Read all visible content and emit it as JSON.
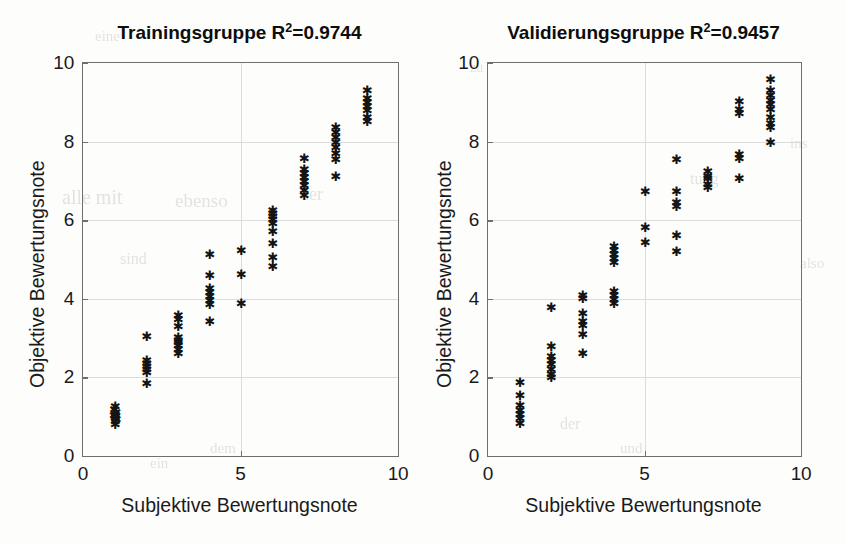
{
  "figure": {
    "background_color": "#fdfdfc",
    "axis_color": "#6f6f6f",
    "grid_color": "#dcdcdc",
    "marker_color": "#141414",
    "marker_glyph": "asterisk"
  },
  "panels": [
    {
      "id": "training",
      "title_main": "Trainingsgruppe R",
      "title_sup": "2",
      "title_tail": "=0.9744",
      "xlabel": "Subjektive Bewertungsnote",
      "ylabel": "Objektive Bewertungsnote",
      "xticks": [
        "0",
        "5",
        "10"
      ],
      "yticks": [
        "0",
        "2",
        "4",
        "6",
        "8",
        "10"
      ]
    },
    {
      "id": "validation",
      "title_main": "Validierungsgruppe R",
      "title_sup": "2",
      "title_tail": "=0.9457",
      "xlabel": "Subjektive Bewertungsnote",
      "ylabel": "Objektive Bewertungsnote",
      "xticks": [
        "0",
        "5",
        "10"
      ],
      "yticks": [
        "0",
        "2",
        "4",
        "6",
        "8",
        "10"
      ]
    }
  ],
  "bleed_artifacts": [
    {
      "text": "alle mit",
      "x": 62,
      "y": 186,
      "size": 20
    },
    {
      "text": "ebenso",
      "x": 175,
      "y": 190,
      "size": 19
    },
    {
      "text": "der",
      "x": 300,
      "y": 184,
      "size": 18
    },
    {
      "text": "eine",
      "x": 95,
      "y": 28,
      "size": 15
    },
    {
      "text": "sind",
      "x": 120,
      "y": 250,
      "size": 16
    },
    {
      "text": "ein",
      "x": 150,
      "y": 455,
      "size": 15
    },
    {
      "text": "dem",
      "x": 210,
      "y": 440,
      "size": 15
    },
    {
      "text": "tung",
      "x": 690,
      "y": 170,
      "size": 16
    },
    {
      "text": "ins",
      "x": 790,
      "y": 135,
      "size": 15
    },
    {
      "text": "der",
      "x": 560,
      "y": 415,
      "size": 16
    },
    {
      "text": "und",
      "x": 620,
      "y": 440,
      "size": 15
    },
    {
      "text": "also",
      "x": 800,
      "y": 255,
      "size": 15
    },
    {
      "text": "zu",
      "x": 470,
      "y": 60,
      "size": 14
    }
  ],
  "chart_data": [
    {
      "type": "scatter",
      "title": "Trainingsgruppe R2=0.9744",
      "xlabel": "Subjektive Bewertungsnote",
      "ylabel": "Objektive Bewertungsnote",
      "xlim": [
        0,
        10
      ],
      "ylim": [
        0,
        10
      ],
      "xticks": [
        0,
        5,
        10
      ],
      "yticks": [
        0,
        2,
        4,
        6,
        8,
        10
      ],
      "grid": true,
      "legend": null,
      "marker": "*",
      "r_squared": 0.9744,
      "points": [
        [
          1.0,
          0.8
        ],
        [
          1.0,
          0.88
        ],
        [
          1.0,
          0.95
        ],
        [
          1.0,
          1.0
        ],
        [
          1.0,
          1.05
        ],
        [
          1.02,
          1.1
        ],
        [
          0.98,
          1.18
        ],
        [
          1.0,
          1.25
        ],
        [
          1.03,
          0.92
        ],
        [
          0.97,
          1.02
        ],
        [
          2.0,
          1.85
        ],
        [
          2.0,
          2.12
        ],
        [
          2.0,
          2.2
        ],
        [
          2.0,
          2.28
        ],
        [
          2.0,
          2.35
        ],
        [
          2.0,
          2.42
        ],
        [
          2.0,
          3.05
        ],
        [
          3.0,
          2.62
        ],
        [
          3.0,
          2.72
        ],
        [
          3.0,
          2.8
        ],
        [
          3.0,
          2.88
        ],
        [
          3.0,
          2.95
        ],
        [
          3.0,
          3.02
        ],
        [
          3.0,
          3.3
        ],
        [
          3.0,
          3.48
        ],
        [
          3.0,
          3.58
        ],
        [
          4.0,
          3.42
        ],
        [
          4.0,
          3.85
        ],
        [
          4.0,
          3.95
        ],
        [
          4.0,
          4.05
        ],
        [
          4.0,
          4.15
        ],
        [
          4.0,
          4.25
        ],
        [
          4.0,
          4.6
        ],
        [
          4.0,
          5.12
        ],
        [
          5.0,
          3.88
        ],
        [
          5.0,
          4.62
        ],
        [
          5.0,
          5.22
        ],
        [
          6.0,
          4.82
        ],
        [
          6.0,
          5.05
        ],
        [
          6.0,
          5.4
        ],
        [
          6.0,
          5.72
        ],
        [
          6.0,
          5.92
        ],
        [
          6.0,
          6.02
        ],
        [
          6.0,
          6.1
        ],
        [
          6.0,
          6.18
        ],
        [
          6.0,
          6.25
        ],
        [
          7.0,
          6.62
        ],
        [
          7.0,
          6.75
        ],
        [
          7.0,
          6.88
        ],
        [
          7.0,
          6.98
        ],
        [
          7.0,
          7.08
        ],
        [
          7.0,
          7.18
        ],
        [
          7.0,
          7.28
        ],
        [
          7.0,
          7.58
        ],
        [
          8.0,
          7.1
        ],
        [
          8.0,
          7.55
        ],
        [
          8.0,
          7.7
        ],
        [
          8.0,
          7.85
        ],
        [
          8.0,
          7.98
        ],
        [
          8.0,
          8.1
        ],
        [
          8.0,
          8.22
        ],
        [
          8.0,
          8.35
        ],
        [
          9.0,
          8.52
        ],
        [
          9.0,
          8.62
        ],
        [
          9.0,
          8.78
        ],
        [
          9.0,
          8.9
        ],
        [
          9.0,
          9.0
        ],
        [
          9.0,
          9.1
        ],
        [
          9.0,
          9.3
        ]
      ]
    },
    {
      "type": "scatter",
      "title": "Validierungsgruppe R2=0.9457",
      "xlabel": "Subjektive Bewertungsnote",
      "ylabel": "Objektive Bewertungsnote",
      "xlim": [
        0,
        10
      ],
      "ylim": [
        0,
        10
      ],
      "xticks": [
        0,
        5,
        10
      ],
      "yticks": [
        0,
        2,
        4,
        6,
        8,
        10
      ],
      "grid": true,
      "legend": null,
      "marker": "*",
      "r_squared": 0.9457,
      "points": [
        [
          1.0,
          0.82
        ],
        [
          1.0,
          0.95
        ],
        [
          1.0,
          1.05
        ],
        [
          1.0,
          1.15
        ],
        [
          1.0,
          1.28
        ],
        [
          1.0,
          1.55
        ],
        [
          1.0,
          1.88
        ],
        [
          2.0,
          2.0
        ],
        [
          2.0,
          2.08
        ],
        [
          2.0,
          2.2
        ],
        [
          2.0,
          2.32
        ],
        [
          2.0,
          2.42
        ],
        [
          2.0,
          2.52
        ],
        [
          2.0,
          2.78
        ],
        [
          2.0,
          3.78
        ],
        [
          3.0,
          2.62
        ],
        [
          3.0,
          3.08
        ],
        [
          3.0,
          3.32
        ],
        [
          3.0,
          3.42
        ],
        [
          3.0,
          3.62
        ],
        [
          3.0,
          4.02
        ],
        [
          3.0,
          4.08
        ],
        [
          4.0,
          3.88
        ],
        [
          4.0,
          3.98
        ],
        [
          4.0,
          4.08
        ],
        [
          4.0,
          4.18
        ],
        [
          4.0,
          4.92
        ],
        [
          4.0,
          5.02
        ],
        [
          4.0,
          5.12
        ],
        [
          4.0,
          5.22
        ],
        [
          4.0,
          5.32
        ],
        [
          5.0,
          5.42
        ],
        [
          5.0,
          5.82
        ],
        [
          5.0,
          6.72
        ],
        [
          6.0,
          5.2
        ],
        [
          6.0,
          5.6
        ],
        [
          6.0,
          6.35
        ],
        [
          6.0,
          6.45
        ],
        [
          6.0,
          6.72
        ],
        [
          6.0,
          7.55
        ],
        [
          7.0,
          6.82
        ],
        [
          7.0,
          6.92
        ],
        [
          7.0,
          7.05
        ],
        [
          7.0,
          7.12
        ],
        [
          7.0,
          7.25
        ],
        [
          8.0,
          7.05
        ],
        [
          8.0,
          7.58
        ],
        [
          8.0,
          7.68
        ],
        [
          8.0,
          8.72
        ],
        [
          8.0,
          8.82
        ],
        [
          8.0,
          9.02
        ],
        [
          9.0,
          7.98
        ],
        [
          9.0,
          8.35
        ],
        [
          9.0,
          8.45
        ],
        [
          9.0,
          8.62
        ],
        [
          9.0,
          8.82
        ],
        [
          9.0,
          8.95
        ],
        [
          9.0,
          9.05
        ],
        [
          9.0,
          9.18
        ],
        [
          9.0,
          9.3
        ],
        [
          9.0,
          9.58
        ]
      ]
    }
  ]
}
